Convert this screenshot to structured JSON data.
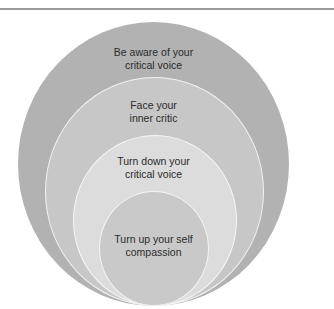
{
  "diagram": {
    "type": "nested-ellipses",
    "colors": {
      "rule": "#9a9a9a",
      "ring_1": "#b2b2b2",
      "ring_2": "#c7c7c7",
      "ring_3": "#dcdcdc",
      "ring_4": "#c9c9c9",
      "ring_border": "#f4f4f4",
      "text": "#2b2b2b"
    },
    "layers": [
      {
        "lines": [
          "Be aware of your",
          "critical voice"
        ]
      },
      {
        "lines": [
          "Face your",
          "inner critic"
        ]
      },
      {
        "lines": [
          "Turn down your",
          "critical voice"
        ]
      },
      {
        "lines": [
          "Turn up your self",
          "compassion"
        ]
      }
    ]
  }
}
